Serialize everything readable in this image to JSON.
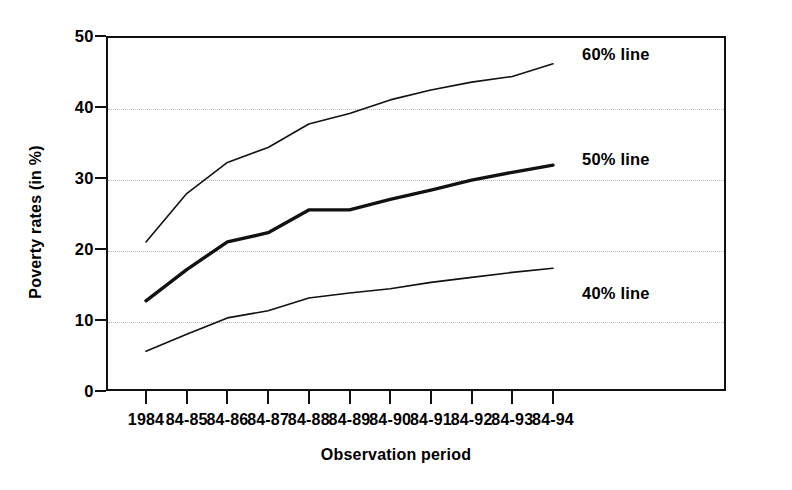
{
  "chart_data": {
    "type": "line",
    "title": "",
    "xlabel": "Observation period",
    "ylabel": "Poverty rates (in %)",
    "categories": [
      "1984",
      "84-85",
      "84-86",
      "84-87",
      "84-88",
      "84-89",
      "84-90",
      "84-91",
      "84-92",
      "84-93",
      "84-94"
    ],
    "ylim": [
      0,
      50
    ],
    "yticks": [
      0,
      10,
      20,
      30,
      40,
      50
    ],
    "ytick_labels": [
      "0",
      "10",
      "20",
      "30",
      "40",
      "50"
    ],
    "grid": "horizontal-dotted",
    "legend": "inline-annotations",
    "series": [
      {
        "name": "60% line",
        "label": "60% line",
        "color": "#111111",
        "width": 1.6,
        "values": [
          21.0,
          27.8,
          32.2,
          34.3,
          37.6,
          39.1,
          41.0,
          42.4,
          43.5,
          44.3,
          46.1
        ]
      },
      {
        "name": "50% line",
        "label": "50% line",
        "color": "#111111",
        "width": 3.4,
        "values": [
          12.7,
          17.1,
          21.0,
          22.3,
          25.5,
          25.5,
          27.0,
          28.3,
          29.7,
          30.8,
          31.8
        ]
      },
      {
        "name": "40% line",
        "label": "40% line",
        "color": "#111111",
        "width": 1.6,
        "values": [
          5.6,
          8.0,
          10.3,
          11.3,
          13.1,
          13.8,
          14.4,
          15.3,
          16.0,
          16.7,
          17.3
        ]
      }
    ],
    "annotations": [
      {
        "text": "60% line",
        "x_px": 582,
        "y_px": 45
      },
      {
        "text": "50% line",
        "x_px": 582,
        "y_px": 150
      },
      {
        "text": "40% line",
        "x_px": 582,
        "y_px": 284
      }
    ]
  }
}
